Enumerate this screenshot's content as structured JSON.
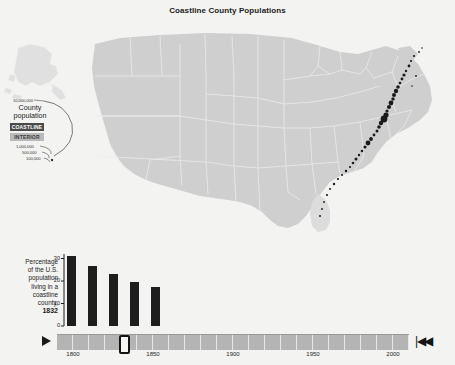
{
  "title": "Coastline County Populations",
  "legend": {
    "top_value": "10,000,000",
    "title": "County population",
    "coastline_label": "COASTLINE",
    "interior_label": "INTERIOR",
    "scale_values": [
      "1,000,000",
      "500,000",
      "100,000"
    ],
    "coastline_color": "#4a4a4a",
    "interior_color": "#b9b9b9"
  },
  "map": {
    "land_color": "#cfcfcf",
    "border_color": "#ebebeb",
    "dot_color": "#1a1a1a",
    "inset_color": "#e2e2e2",
    "alaska_name": "alaska-inset",
    "lower48_name": "lower-48-states"
  },
  "chart_data": {
    "type": "bar",
    "title": "Percentage of the U.S. population living in a coastline county",
    "caption_lines": [
      "Percentage",
      "of the U.S.",
      "population",
      "living in a",
      "coastline",
      "county,"
    ],
    "year": "1832",
    "xlabel": "",
    "ylabel": "",
    "ylim": [
      0,
      32
    ],
    "yticks": [
      0,
      10,
      20,
      30
    ],
    "ytick_labels": [
      "0",
      "10",
      "20",
      "30"
    ],
    "categories": [
      "b1",
      "b2",
      "b3",
      "b4",
      "b5"
    ],
    "values": [
      31,
      26.5,
      23,
      19.5,
      17.5
    ],
    "bar_color": "#1e1e1e",
    "grid": false,
    "legend_position": "none"
  },
  "timeline": {
    "play_icon": "play-icon",
    "rewind_icon": "▌◀◀",
    "rewind_label": "|◀◀",
    "current_year": "1832",
    "range": [
      1790,
      2010
    ],
    "ticks": [
      "1800",
      "1850",
      "1900",
      "1950",
      "2000"
    ],
    "tick_years": [
      1800,
      1850,
      1900,
      1950,
      2000
    ],
    "handle_position_year": 1832,
    "segment_count": 22
  }
}
